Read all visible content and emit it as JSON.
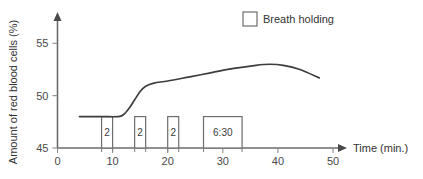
{
  "chart_data": {
    "type": "line",
    "title": "",
    "xlabel": "Time (min.)",
    "ylabel": "Amount of red blood cells (%)",
    "xlim": [
      0,
      50
    ],
    "ylim": [
      45,
      57
    ],
    "grid": false,
    "x_ticks": [
      0,
      10,
      20,
      30,
      40,
      50
    ],
    "x_tick_labels": [
      "0",
      "10",
      "20",
      "30",
      "40",
      "50"
    ],
    "y_ticks": [
      45,
      50,
      55
    ],
    "y_tick_labels": [
      "45",
      "50",
      "55"
    ],
    "minor_x_ticks": [
      8,
      10,
      14,
      16,
      20,
      22,
      26.5,
      33.5
    ],
    "legend": {
      "position": "top-right",
      "entries": [
        {
          "label": "Breath holding",
          "marker": "open-square"
        }
      ]
    },
    "series": [
      {
        "name": "Amount of red blood cells",
        "type": "line",
        "points": [
          {
            "x": 4.0,
            "y": 48.0
          },
          {
            "x": 8.0,
            "y": 48.0
          },
          {
            "x": 11.0,
            "y": 48.0
          },
          {
            "x": 12.0,
            "y": 48.2
          },
          {
            "x": 13.0,
            "y": 48.8
          },
          {
            "x": 14.0,
            "y": 49.6
          },
          {
            "x": 15.0,
            "y": 50.4
          },
          {
            "x": 16.0,
            "y": 50.9
          },
          {
            "x": 17.5,
            "y": 51.2
          },
          {
            "x": 20.0,
            "y": 51.4
          },
          {
            "x": 24.0,
            "y": 51.8
          },
          {
            "x": 28.0,
            "y": 52.2
          },
          {
            "x": 32.0,
            "y": 52.6
          },
          {
            "x": 36.0,
            "y": 52.9
          },
          {
            "x": 38.5,
            "y": 53.0
          },
          {
            "x": 41.0,
            "y": 52.9
          },
          {
            "x": 44.0,
            "y": 52.5
          },
          {
            "x": 47.5,
            "y": 51.7
          }
        ]
      },
      {
        "name": "Breath holding",
        "type": "bar",
        "baseline": 45,
        "top": 48,
        "bars": [
          {
            "x_start": 8.0,
            "x_end": 10.0,
            "label": "2"
          },
          {
            "x_start": 14.0,
            "x_end": 16.0,
            "label": "2"
          },
          {
            "x_start": 20.0,
            "x_end": 22.0,
            "label": "2"
          },
          {
            "x_start": 26.5,
            "x_end": 33.5,
            "label": "6:30"
          }
        ]
      }
    ]
  }
}
